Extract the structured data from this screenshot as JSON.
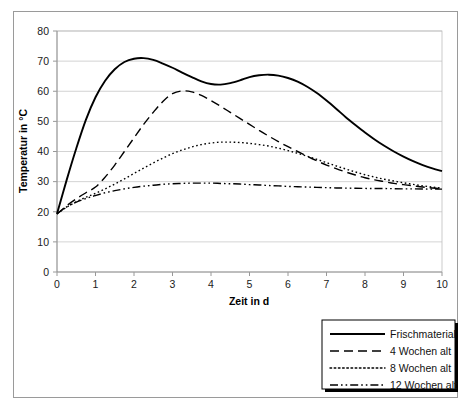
{
  "chart_data": {
    "type": "line",
    "title": "",
    "xlabel": "Zeit in d",
    "ylabel": "Temperatur in °C",
    "xlim": [
      0,
      10
    ],
    "ylim": [
      0,
      80
    ],
    "xticks": [
      "0",
      "1",
      "2",
      "3",
      "4",
      "5",
      "6",
      "7",
      "8",
      "9",
      "10"
    ],
    "yticks": [
      "0",
      "10",
      "20",
      "30",
      "40",
      "50",
      "60",
      "70",
      "80"
    ],
    "grid": "horizontal",
    "legend_position": "bottom-right-outside",
    "x": [
      0,
      0.25,
      0.5,
      0.75,
      1,
      1.25,
      1.5,
      1.75,
      2,
      2.25,
      2.5,
      2.75,
      3,
      3.25,
      3.5,
      3.75,
      4,
      4.25,
      4.5,
      4.75,
      5,
      5.25,
      5.5,
      5.75,
      6,
      6.25,
      6.5,
      6.75,
      7,
      7.25,
      7.5,
      7.75,
      8,
      8.25,
      8.5,
      8.75,
      9,
      9.25,
      9.5,
      9.75,
      10
    ],
    "series": [
      {
        "name": "Frischmaterial",
        "style": "solid",
        "color": "#000000",
        "values": [
          19.3,
          30.5,
          41.0,
          50.5,
          58.0,
          63.5,
          67.3,
          69.7,
          70.8,
          71.0,
          70.4,
          69.2,
          67.8,
          66.2,
          64.7,
          63.3,
          62.4,
          62.2,
          62.7,
          63.6,
          64.7,
          65.3,
          65.5,
          65.2,
          64.4,
          63.2,
          61.5,
          59.4,
          56.9,
          54.2,
          51.4,
          48.8,
          46.3,
          44.0,
          41.9,
          40.0,
          38.3,
          36.8,
          35.5,
          34.4,
          33.5
        ]
      },
      {
        "name": "4 Wochen alt",
        "style": "dashed",
        "color": "#000000",
        "values": [
          19.3,
          22.0,
          24.3,
          26.3,
          28.2,
          31.5,
          35.5,
          40.0,
          44.5,
          49.0,
          53.0,
          56.6,
          59.2,
          60.1,
          59.8,
          58.6,
          56.9,
          55.0,
          53.0,
          51.0,
          49.0,
          47.0,
          45.1,
          43.3,
          41.6,
          40.0,
          38.4,
          36.9,
          35.5,
          34.3,
          33.2,
          32.2,
          31.3,
          30.6,
          30.0,
          29.4,
          29.0,
          28.6,
          28.2,
          27.9,
          27.6
        ]
      },
      {
        "name": "8 Wochen alt",
        "style": "dotted",
        "color": "#000000",
        "values": [
          19.3,
          21.5,
          23.3,
          24.8,
          26.1,
          27.6,
          29.2,
          30.9,
          32.7,
          34.5,
          36.2,
          37.8,
          39.3,
          40.5,
          41.5,
          42.3,
          42.8,
          43.1,
          43.1,
          43.0,
          42.7,
          42.3,
          41.8,
          41.1,
          40.3,
          39.4,
          38.4,
          37.4,
          36.3,
          35.2,
          34.2,
          33.2,
          32.3,
          31.5,
          30.8,
          30.2,
          29.6,
          29.1,
          28.6,
          28.2,
          27.8
        ]
      },
      {
        "name": "12 Wochen alt",
        "style": "dashdotdot",
        "color": "#000000",
        "values": [
          19.3,
          21.6,
          23.2,
          24.4,
          25.4,
          26.3,
          27.0,
          27.6,
          28.1,
          28.5,
          28.8,
          29.1,
          29.3,
          29.4,
          29.5,
          29.5,
          29.5,
          29.4,
          29.3,
          29.2,
          29.0,
          28.9,
          28.7,
          28.6,
          28.4,
          28.3,
          28.2,
          28.1,
          28.0,
          27.9,
          27.85,
          27.8,
          27.75,
          27.7,
          27.7,
          27.65,
          27.6,
          27.6,
          27.55,
          27.5,
          27.5
        ]
      }
    ],
    "legend": [
      {
        "label": "Frischmaterial",
        "style": "solid"
      },
      {
        "label": "4 Wochen alt",
        "style": "dashed"
      },
      {
        "label": "8 Wochen alt",
        "style": "dotted"
      },
      {
        "label": "12 Wochen alt",
        "style": "dashdotdot"
      }
    ]
  }
}
